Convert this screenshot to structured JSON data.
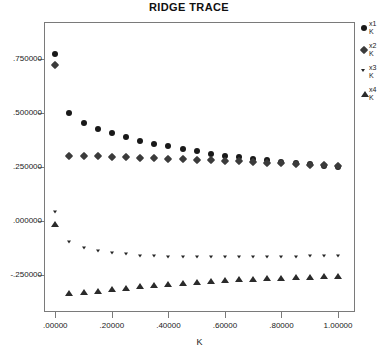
{
  "chart_data": {
    "type": "scatter",
    "title": "RIDGE TRACE",
    "xlabel": "K",
    "ylabel": "",
    "xlim": [
      -0.04,
      1.06
    ],
    "ylim": [
      -0.42,
      0.92
    ],
    "grid": false,
    "legend_position": "right-outside",
    "xticks": [
      0.0,
      0.2,
      0.4,
      0.6,
      0.8,
      1.0
    ],
    "xticklabels": [
      ".00000",
      ".20000",
      ".40000",
      ".60000",
      ".80000",
      "1.00000"
    ],
    "yticks": [
      0.75,
      0.5,
      0.25,
      0.0,
      -0.25
    ],
    "yticklabels": [
      ".750000",
      ".500000",
      ".250000",
      ".000000",
      "-.250000"
    ],
    "x": [
      0.0,
      0.05,
      0.1,
      0.15,
      0.2,
      0.25,
      0.3,
      0.35,
      0.4,
      0.45,
      0.5,
      0.55,
      0.6,
      0.65,
      0.7,
      0.75,
      0.8,
      0.85,
      0.9,
      0.95,
      1.0
    ],
    "series": [
      {
        "name": "x1 K",
        "label_line1": "x1",
        "label_line2": "K",
        "marker": "circle",
        "color": "#191919",
        "values": [
          0.77,
          0.5,
          0.455,
          0.425,
          0.405,
          0.387,
          0.372,
          0.358,
          0.345,
          0.333,
          0.322,
          0.312,
          0.303,
          0.295,
          0.288,
          0.281,
          0.274,
          0.268,
          0.262,
          0.256,
          0.251
        ]
      },
      {
        "name": "x2 K",
        "label_line1": "x2",
        "label_line2": "K",
        "marker": "diamond",
        "color": "#3b3b3b",
        "values": [
          0.72,
          0.302,
          0.3,
          0.299,
          0.297,
          0.295,
          0.293,
          0.291,
          0.289,
          0.287,
          0.284,
          0.282,
          0.279,
          0.276,
          0.273,
          0.27,
          0.267,
          0.264,
          0.261,
          0.258,
          0.255
        ]
      },
      {
        "name": "x3 K",
        "label_line1": "x3",
        "label_line2": "K",
        "marker": "triangle-down",
        "color": "#262626",
        "values": [
          0.04,
          -0.098,
          -0.122,
          -0.137,
          -0.147,
          -0.154,
          -0.159,
          -0.162,
          -0.164,
          -0.166,
          -0.167,
          -0.167,
          -0.167,
          -0.167,
          -0.166,
          -0.166,
          -0.165,
          -0.164,
          -0.163,
          -0.162,
          -0.161
        ]
      },
      {
        "name": "x4 K",
        "label_line1": "x4",
        "label_line2": "K",
        "marker": "triangle-up",
        "color": "#2b2b2b",
        "values": [
          -0.012,
          -0.333,
          -0.329,
          -0.322,
          -0.314,
          -0.307,
          -0.3,
          -0.294,
          -0.289,
          -0.284,
          -0.28,
          -0.276,
          -0.272,
          -0.269,
          -0.266,
          -0.263,
          -0.261,
          -0.258,
          -0.256,
          -0.254,
          -0.252
        ]
      }
    ]
  }
}
